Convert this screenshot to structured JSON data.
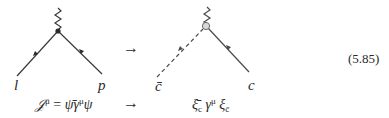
{
  "equation_number": "(5.85)",
  "arrow_symbol": "→",
  "left_diagram": {
    "vertex": "filled-dot",
    "external_line": "zigzag (current)",
    "incoming_label": "l",
    "outgoing_label": "p",
    "current": {
      "lhs": "𝒥",
      "lhs_sup": "μ",
      "equals": "=",
      "psibar": "ψ̄",
      "gamma": "γ",
      "gamma_sup": "μ",
      "psi": "ψ"
    }
  },
  "right_diagram": {
    "vertex": "open-circle",
    "external_line": "zigzag (current)",
    "incoming_label": "c̄",
    "incoming_style": "dashed",
    "outgoing_label": "c",
    "outgoing_style": "solid",
    "current": {
      "xibar": "ξ̄",
      "xibar_sub": "c",
      "gamma": "γ",
      "gamma_sup": "μ",
      "xi": "ξ",
      "xi_sub": "c̄"
    }
  }
}
